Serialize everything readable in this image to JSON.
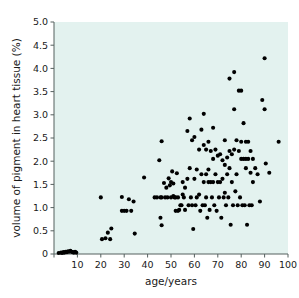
{
  "chart_data": {
    "type": "scatter",
    "title": "",
    "xlabel": "age/years",
    "ylabel": "volume of pigment in heart tissue (%)",
    "xlim": [
      0,
      100
    ],
    "ylim": [
      0,
      5.0
    ],
    "grid": false,
    "legend": null,
    "marker": {
      "shape": "circle",
      "color": "#000000",
      "size": 3.0
    },
    "plot_background_color": "#e3f2ef",
    "figure_background_color": "#ffffff",
    "axis_color": "#55605f",
    "xticks": [
      0,
      10,
      20,
      30,
      40,
      50,
      60,
      70,
      80,
      90,
      100
    ],
    "xticklabels": [
      "0",
      "10",
      "20",
      "30",
      "40",
      "50",
      "60",
      "70",
      "80",
      "90",
      "100"
    ],
    "yticks": [
      0,
      0.5,
      1.0,
      1.5,
      2.0,
      2.5,
      3.0,
      3.5,
      4.0,
      4.5,
      5.0
    ],
    "yticklabels": [
      "0",
      "0.5",
      "1.0",
      "1.5",
      "2.0",
      "2.5",
      "3.0",
      "3.5",
      "4.0",
      "4.5",
      "5.0"
    ],
    "n_points": 163,
    "points": [
      [
        2,
        0.02
      ],
      [
        3,
        0.03
      ],
      [
        3.5,
        0.02
      ],
      [
        4,
        0.04
      ],
      [
        4.5,
        0.03
      ],
      [
        5,
        0.05
      ],
      [
        5.5,
        0.04
      ],
      [
        6,
        0.06
      ],
      [
        6.5,
        0.05
      ],
      [
        7,
        0.07
      ],
      [
        7.5,
        0.05
      ],
      [
        8,
        0.04
      ],
      [
        8.5,
        0.03
      ],
      [
        9,
        0.05
      ],
      [
        9.5,
        0.03
      ],
      [
        20,
        1.22
      ],
      [
        20.5,
        0.32
      ],
      [
        22,
        0.34
      ],
      [
        23,
        0.46
      ],
      [
        24,
        0.32
      ],
      [
        24.5,
        0.55
      ],
      [
        29,
        1.23
      ],
      [
        29,
        0.93
      ],
      [
        30,
        0.93
      ],
      [
        31,
        0.93
      ],
      [
        32,
        1.18
      ],
      [
        33,
        0.93
      ],
      [
        34,
        1.13
      ],
      [
        34.5,
        0.44
      ],
      [
        38.5,
        1.65
      ],
      [
        43,
        1.22
      ],
      [
        44,
        1.22
      ],
      [
        45,
        2.02
      ],
      [
        45.5,
        1.22
      ],
      [
        45.5,
        0.78
      ],
      [
        46,
        2.43
      ],
      [
        46,
        1.22
      ],
      [
        46,
        0.62
      ],
      [
        47,
        1.53
      ],
      [
        47.5,
        1.22
      ],
      [
        48,
        1.43
      ],
      [
        48.5,
        1.22
      ],
      [
        49,
        1.63
      ],
      [
        49.5,
        1.48
      ],
      [
        50,
        1.22
      ],
      [
        50,
        1.55
      ],
      [
        50.5,
        1.78
      ],
      [
        51,
        1.25
      ],
      [
        51,
        1.52
      ],
      [
        51.5,
        1.22
      ],
      [
        52,
        1.22
      ],
      [
        52,
        0.93
      ],
      [
        52.5,
        1.74
      ],
      [
        53,
        1.22
      ],
      [
        53,
        0.93
      ],
      [
        53.5,
        0.95
      ],
      [
        54,
        1.05
      ],
      [
        54.5,
        1.05
      ],
      [
        55,
        1.28
      ],
      [
        55,
        1.55
      ],
      [
        55.5,
        1.22
      ],
      [
        56,
        1.43
      ],
      [
        56,
        0.95
      ],
      [
        57,
        2.65
      ],
      [
        57,
        1.62
      ],
      [
        57.5,
        1.05
      ],
      [
        58,
        2.92
      ],
      [
        58,
        1.85
      ],
      [
        58.5,
        1.22
      ],
      [
        59,
        2.45
      ],
      [
        59,
        1.05
      ],
      [
        59.5,
        0.54
      ],
      [
        60,
        2.52
      ],
      [
        60,
        1.62
      ],
      [
        60.5,
        1.05
      ],
      [
        61,
        1.82
      ],
      [
        61,
        1.22
      ],
      [
        62,
        2.25
      ],
      [
        62,
        1.28
      ],
      [
        62.5,
        0.93
      ],
      [
        63,
        2.68
      ],
      [
        63,
        1.72
      ],
      [
        63.5,
        1.05
      ],
      [
        64,
        3.02
      ],
      [
        64,
        2.35
      ],
      [
        64,
        1.55
      ],
      [
        64.5,
        1.05
      ],
      [
        65,
        2.25
      ],
      [
        65,
        1.72
      ],
      [
        65,
        1.22
      ],
      [
        65.5,
        0.78
      ],
      [
        66,
        2.42
      ],
      [
        66,
        1.82
      ],
      [
        66,
        1.55
      ],
      [
        66.5,
        0.95
      ],
      [
        67,
        2.22
      ],
      [
        67,
        1.55
      ],
      [
        67.5,
        1.22
      ],
      [
        68,
        2.72
      ],
      [
        68,
        2.05
      ],
      [
        68,
        1.55
      ],
      [
        68.5,
        1.05
      ],
      [
        69,
        2.25
      ],
      [
        69,
        1.72
      ],
      [
        69.5,
        0.93
      ],
      [
        70,
        2.12
      ],
      [
        70,
        1.55
      ],
      [
        70.5,
        1.22
      ],
      [
        71,
        2.15
      ],
      [
        71,
        1.55
      ],
      [
        71.5,
        0.78
      ],
      [
        72,
        2.02
      ],
      [
        72,
        1.62
      ],
      [
        72.5,
        1.22
      ],
      [
        73,
        2.45
      ],
      [
        73,
        1.92
      ],
      [
        73,
        1.32
      ],
      [
        73.5,
        1.05
      ],
      [
        74,
        2.08
      ],
      [
        74,
        1.72
      ],
      [
        74.5,
        1.22
      ],
      [
        75,
        3.78
      ],
      [
        75,
        2.22
      ],
      [
        75,
        1.85
      ],
      [
        75.5,
        0.63
      ],
      [
        76,
        2.15
      ],
      [
        76,
        1.55
      ],
      [
        76.5,
        1.05
      ],
      [
        77,
        3.92
      ],
      [
        77,
        3.12
      ],
      [
        77,
        2.25
      ],
      [
        77.5,
        1.35
      ],
      [
        78,
        2.45
      ],
      [
        78,
        1.72
      ],
      [
        78.5,
        1.05
      ],
      [
        79,
        3.52
      ],
      [
        79,
        2.22
      ],
      [
        79.5,
        1.22
      ],
      [
        80,
        3.52
      ],
      [
        80,
        2.42
      ],
      [
        80,
        2.05
      ],
      [
        80.5,
        1.05
      ],
      [
        81,
        2.82
      ],
      [
        81,
        2.05
      ],
      [
        81.5,
        1.05
      ],
      [
        82,
        2.42
      ],
      [
        82,
        2.05
      ],
      [
        82,
        1.85
      ],
      [
        82.5,
        0.63
      ],
      [
        83,
        2.42
      ],
      [
        83,
        2.05
      ],
      [
        83.5,
        1.05
      ],
      [
        84,
        2.22
      ],
      [
        84,
        1.75
      ],
      [
        84.5,
        1.05
      ],
      [
        85,
        2.05
      ],
      [
        85,
        1.55
      ],
      [
        86,
        1.85
      ],
      [
        87,
        1.72
      ],
      [
        88,
        1.13
      ],
      [
        89,
        3.32
      ],
      [
        90,
        4.22
      ],
      [
        90,
        3.12
      ],
      [
        90.5,
        1.95
      ],
      [
        92,
        1.75
      ],
      [
        96,
        2.42
      ]
    ]
  },
  "figure": {
    "caption": ""
  }
}
